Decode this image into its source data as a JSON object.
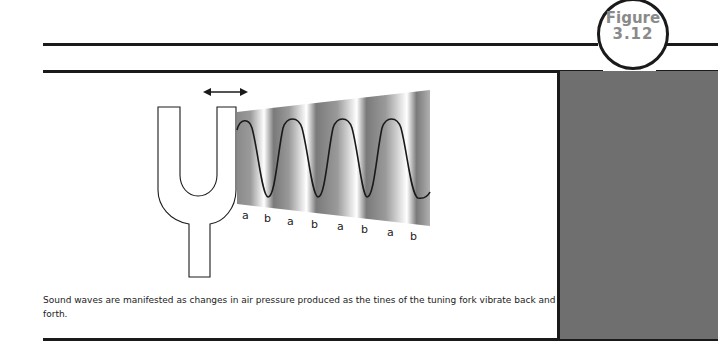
{
  "figure": {
    "label_line1": "Figure",
    "label_line2": "3.12"
  },
  "diagram": {
    "motion_arrow": "double-headed horizontal arrow above tines",
    "wave_labels": [
      "a",
      "b",
      "a",
      "b",
      "a",
      "b",
      "a",
      "b"
    ],
    "colors": {
      "line": "#1a1a1a",
      "panel": "#6f6f6f",
      "badge_text": "#8a8a8a"
    }
  },
  "caption": {
    "text": "Sound waves are manifested as changes in air pressure produced as the tines of the tuning fork vibrate back and forth."
  }
}
